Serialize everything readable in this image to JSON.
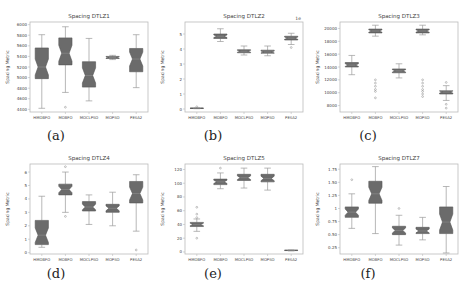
{
  "chart_data": [
    {
      "type": "box",
      "caption": "(a)",
      "title": "Spacing DTLZ1",
      "xlabel": "",
      "ylabel": "Spacing Metric",
      "categories": [
        "HMOBFO",
        "MOBFO",
        "MOCLPSO",
        "MOPSO",
        "PESA2"
      ],
      "ylim": [
        4350,
        6050
      ],
      "yticks": [
        4400,
        4600,
        4800,
        5000,
        5200,
        5400,
        5600,
        5800,
        6000
      ],
      "boxes": [
        {
          "whislo": 4420,
          "q1": 4980,
          "med": 5200,
          "q3": 5560,
          "whishi": 5810,
          "fliers": []
        },
        {
          "whislo": 4720,
          "q1": 5240,
          "med": 5460,
          "q3": 5750,
          "whishi": 5960,
          "fliers": [
            4440
          ]
        },
        {
          "whislo": 4560,
          "q1": 4820,
          "med": 5040,
          "q3": 5300,
          "whishi": 5740,
          "fliers": []
        },
        {
          "whislo": 5340,
          "q1": 5360,
          "med": 5380,
          "q3": 5400,
          "whishi": 5420,
          "fliers": []
        },
        {
          "whislo": 4810,
          "q1": 5110,
          "med": 5350,
          "q3": 5550,
          "whishi": 5810,
          "fliers": []
        }
      ]
    },
    {
      "type": "box",
      "caption": "(b)",
      "title": "Spacing DTLZ2",
      "xlabel": "",
      "ylabel": "Spacing Metric",
      "offset_text": "1e",
      "categories": [
        "HMOBFO",
        "MOBFO",
        "MOCLPSO",
        "MOPSO",
        "PESA2"
      ],
      "ylim": [
        -0.2,
        5.8
      ],
      "yticks": [
        0,
        1,
        2,
        3,
        4,
        5
      ],
      "boxes": [
        {
          "whislo": 0.02,
          "q1": 0.04,
          "med": 0.05,
          "q3": 0.06,
          "whishi": 0.08,
          "fliers": [
            0.15
          ]
        },
        {
          "whislo": 4.5,
          "q1": 4.7,
          "med": 4.85,
          "q3": 5.0,
          "whishi": 5.35,
          "fliers": []
        },
        {
          "whislo": 3.6,
          "q1": 3.75,
          "med": 3.85,
          "q3": 3.95,
          "whishi": 4.2,
          "fliers": []
        },
        {
          "whislo": 3.55,
          "q1": 3.72,
          "med": 3.8,
          "q3": 3.92,
          "whishi": 4.2,
          "fliers": []
        },
        {
          "whislo": 4.3,
          "q1": 4.6,
          "med": 4.72,
          "q3": 4.85,
          "whishi": 5.05,
          "fliers": [
            4.1
          ]
        }
      ]
    },
    {
      "type": "box",
      "caption": "(c)",
      "title": "Spacing DTLZ3",
      "xlabel": "",
      "ylabel": "Spacing Metric",
      "categories": [
        "HMOBFO",
        "MOBFO",
        "MOCLPSO",
        "MOPSO",
        "PESA2"
      ],
      "ylim": [
        7000,
        21000
      ],
      "yticks": [
        8000,
        10000,
        12000,
        14000,
        16000,
        18000,
        20000
      ],
      "boxes": [
        {
          "whislo": 12800,
          "q1": 14000,
          "med": 14300,
          "q3": 14700,
          "whishi": 15800,
          "fliers": []
        },
        {
          "whislo": 18800,
          "q1": 19300,
          "med": 19600,
          "q3": 19900,
          "whishi": 20500,
          "fliers": [
            12000,
            11500,
            11000,
            10500,
            10200,
            9200
          ]
        },
        {
          "whislo": 12300,
          "q1": 13100,
          "med": 13400,
          "q3": 13700,
          "whishi": 14500,
          "fliers": []
        },
        {
          "whislo": 19000,
          "q1": 19300,
          "med": 19600,
          "q3": 19900,
          "whishi": 20500,
          "fliers": [
            12000,
            11500,
            11000,
            10500,
            10200,
            9800,
            9400
          ]
        },
        {
          "whislo": 8800,
          "q1": 9800,
          "med": 10100,
          "q3": 10300,
          "whishi": 11100,
          "fliers": [
            11600,
            8200,
            7600
          ]
        }
      ]
    },
    {
      "type": "box",
      "caption": "(d)",
      "title": "Spacing DTLZ4",
      "xlabel": "",
      "ylabel": "Spacing Metric",
      "categories": [
        "HMOBFO",
        "MOBFO",
        "MOCLPSO",
        "MOPSO",
        "PESA2"
      ],
      "ylim": [
        -0.1,
        6.6
      ],
      "yticks": [
        0,
        1,
        2,
        3,
        4,
        5,
        6
      ],
      "boxes": [
        {
          "whislo": 0.4,
          "q1": 0.6,
          "med": 1.3,
          "q3": 2.4,
          "whishi": 4.2,
          "fliers": []
        },
        {
          "whislo": 3.0,
          "q1": 4.3,
          "med": 4.7,
          "q3": 5.1,
          "whishi": 6.0,
          "fliers": [
            6.4,
            2.7
          ]
        },
        {
          "whislo": 2.1,
          "q1": 3.1,
          "med": 3.4,
          "q3": 3.8,
          "whishi": 4.3,
          "fliers": []
        },
        {
          "whislo": 2.0,
          "q1": 3.0,
          "med": 3.3,
          "q3": 3.6,
          "whishi": 4.5,
          "fliers": []
        },
        {
          "whislo": 1.6,
          "q1": 3.7,
          "med": 4.4,
          "q3": 5.3,
          "whishi": 5.8,
          "fliers": [
            0.2
          ]
        }
      ]
    },
    {
      "type": "box",
      "caption": "(e)",
      "title": "Spacing DTLZ5",
      "xlabel": "",
      "ylabel": "Spacing Metric",
      "categories": [
        "HMOBFO",
        "MOBFO",
        "MOCLPSO",
        "MOPSO",
        "PESA2"
      ],
      "ylim": [
        -3,
        128
      ],
      "yticks": [
        0,
        20,
        40,
        60,
        80,
        100,
        120
      ],
      "boxes": [
        {
          "whislo": 30,
          "q1": 37,
          "med": 40,
          "q3": 43,
          "whishi": 48,
          "fliers": [
            65,
            55,
            50,
            20
          ]
        },
        {
          "whislo": 92,
          "q1": 98,
          "med": 102,
          "q3": 106,
          "whishi": 115,
          "fliers": [
            122
          ]
        },
        {
          "whislo": 93,
          "q1": 104,
          "med": 108,
          "q3": 113,
          "whishi": 122,
          "fliers": []
        },
        {
          "whislo": 90,
          "q1": 102,
          "med": 107,
          "q3": 113,
          "whishi": 122,
          "fliers": []
        },
        {
          "whislo": 1.5,
          "q1": 2,
          "med": 2.3,
          "q3": 2.6,
          "whishi": 3,
          "fliers": []
        }
      ]
    },
    {
      "type": "box",
      "caption": "(f)",
      "title": "Spacing DTLZ7",
      "xlabel": "",
      "ylabel": "Spacing Metric",
      "categories": [
        "HMOBFO",
        "MOBFO",
        "MOCLPSO",
        "MOPSO",
        "PESA2"
      ],
      "ylim": [
        0.13,
        1.85
      ],
      "yticks": [
        0.25,
        0.5,
        0.75,
        1.0,
        1.25,
        1.5,
        1.75
      ],
      "boxes": [
        {
          "whislo": 0.62,
          "q1": 0.83,
          "med": 0.93,
          "q3": 1.03,
          "whishi": 1.28,
          "fliers": [
            1.55
          ]
        },
        {
          "whislo": 0.52,
          "q1": 1.1,
          "med": 1.28,
          "q3": 1.52,
          "whishi": 1.8,
          "fliers": []
        },
        {
          "whislo": 0.3,
          "q1": 0.5,
          "med": 0.58,
          "q3": 0.66,
          "whishi": 0.87,
          "fliers": [
            1.0
          ]
        },
        {
          "whislo": 0.4,
          "q1": 0.52,
          "med": 0.57,
          "q3": 0.64,
          "whishi": 0.83,
          "fliers": []
        },
        {
          "whislo": 0.15,
          "q1": 0.52,
          "med": 0.74,
          "q3": 1.03,
          "whishi": 1.42,
          "fliers": []
        }
      ]
    }
  ],
  "colors": {
    "box_fill": "#6b6b6b",
    "box_edge": "#555555",
    "whisker": "#9a9a9a",
    "median": "#8a8a8a",
    "axes": "#bbbbbb",
    "text": "#444444"
  }
}
